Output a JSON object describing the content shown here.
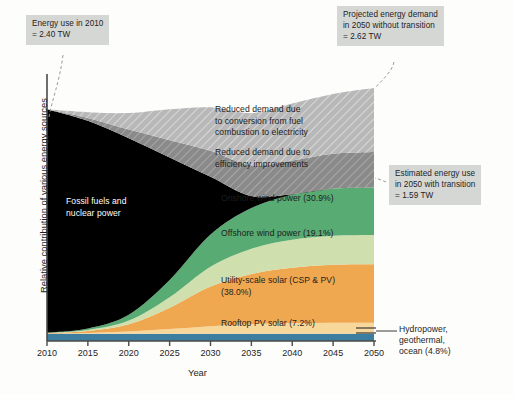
{
  "chart_data": {
    "type": "area",
    "title": "",
    "subtitle": "",
    "xlabel": "Year",
    "ylabel": "Relative contribution of various energy sources",
    "xlim": [
      2010,
      2050
    ],
    "ylim": [
      0,
      2.62
    ],
    "x_unit": "year",
    "y_unit": "TW",
    "grid": false,
    "legend_position": "in-plot labels",
    "x_tick_labels": [
      "2010",
      "2015",
      "2020",
      "2025",
      "2030",
      "2035",
      "2040",
      "2045",
      "2050"
    ],
    "x": [
      2010,
      2015,
      2020,
      2025,
      2030,
      2035,
      2040,
      2045,
      2050
    ],
    "stack_order_bottom_to_top": [
      "Hydropower, geothermal, ocean",
      "Rooftop PV solar",
      "Utility-scale solar (CSP & PV)",
      "Offshore wind power",
      "Onshore wind power",
      "Fossil fuels and nuclear power",
      "Reduced demand due to efficiency improvements",
      "Reduced demand due to conversion from fuel combustion to electricity"
    ],
    "series": [
      {
        "name": "Hydropower, geothermal, ocean",
        "label": "Hydropower,\ngeothermal,\nocean (4.8%)",
        "share_2050_pct": 4.8,
        "color": "#3d7ea0",
        "values": [
          0.076,
          0.076,
          0.076,
          0.076,
          0.076,
          0.076,
          0.076,
          0.076,
          0.076
        ]
      },
      {
        "name": "Rooftop PV solar",
        "label": "Rooftop PV solar (7.2%)",
        "share_2050_pct": 7.2,
        "color": "#f8d79a",
        "values": [
          0.002,
          0.008,
          0.022,
          0.048,
          0.078,
          0.098,
          0.108,
          0.113,
          0.114
        ]
      },
      {
        "name": "Utility-scale solar (CSP & PV)",
        "label": "Utility-scale solar (CSP & PV)\n(38.0%)",
        "share_2050_pct": 38.0,
        "color": "#f0a850",
        "values": [
          0.004,
          0.02,
          0.075,
          0.22,
          0.41,
          0.52,
          0.575,
          0.6,
          0.604
        ]
      },
      {
        "name": "Offshore wind power",
        "label": "Offshore wind power (19.1%)",
        "share_2050_pct": 19.1,
        "color": "#cfdfae",
        "values": [
          0.002,
          0.01,
          0.038,
          0.11,
          0.206,
          0.261,
          0.289,
          0.301,
          0.304
        ]
      },
      {
        "name": "Onshore wind power",
        "label": "Onshore wind power (30.9%)",
        "share_2050_pct": 30.9,
        "color": "#58ab72",
        "values": [
          0.003,
          0.016,
          0.061,
          0.178,
          0.333,
          0.422,
          0.467,
          0.487,
          0.491
        ]
      },
      {
        "name": "Fossil fuels and nuclear power",
        "label": "Fossil fuels and\nnuclear power",
        "share_2050_pct": 0.0,
        "color": "#000000",
        "values": [
          2.313,
          2.15,
          1.828,
          1.268,
          0.597,
          0.123,
          0.005,
          0.0,
          0.0
        ]
      },
      {
        "name": "Reduced demand due to efficiency improvements",
        "label": "Reduced demand due to\nefficiency improvements",
        "color": "#8a8a8a",
        "hatched": true,
        "values": [
          0.0,
          0.03,
          0.09,
          0.18,
          0.27,
          0.32,
          0.35,
          0.362,
          0.368
        ]
      },
      {
        "name": "Reduced demand due to conversion from fuel combustion to electricity",
        "label": "Reduced demand due\nto conversion from fuel\ncombustion to electricity",
        "color": "#b8b8b8",
        "hatched": true,
        "values": [
          0.0,
          0.06,
          0.17,
          0.32,
          0.45,
          0.54,
          0.59,
          0.62,
          0.663
        ]
      }
    ],
    "annotations": [
      {
        "id": "energy-use-2010",
        "text": "Energy use in 2010\n= 2.40 TW",
        "value": 2.4,
        "year": 2010,
        "style": "gray-box-with-dashed-leader"
      },
      {
        "id": "projected-demand-2050",
        "text": "Projected energy demand\nin 2050 without transition\n= 2.62 TW",
        "value": 2.62,
        "year": 2050,
        "style": "gray-box-with-dashed-leader"
      },
      {
        "id": "estimated-use-2050",
        "text": "Estimated energy use\nin 2050 with transition\n= 1.59 TW",
        "value": 1.59,
        "year": 2050,
        "style": "gray-box-with-dashed-leader"
      },
      {
        "id": "hydropower-leader",
        "text": "Hydropower,\ngeothermal,\nocean (4.8%)",
        "style": "solid-leader-line"
      }
    ]
  },
  "colors": {
    "background": "#fdfdfc",
    "callout_bg": "#d5d7d5",
    "axis": "#4a4a4a",
    "text": "#1d1d1d",
    "fossil": "#000000",
    "onshore_wind": "#58ab72",
    "offshore_wind": "#cfdfae",
    "utility_solar": "#f0a850",
    "rooftop_pv": "#f8d79a",
    "hydro": "#3d7ea0",
    "reduced_conversion": "#b8b8b8",
    "reduced_efficiency": "#8a8a8a"
  }
}
